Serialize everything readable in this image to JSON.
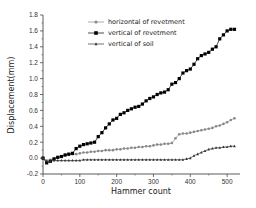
{
  "chart_data": {
    "type": "line",
    "title": "",
    "xlabel": "Hammer count",
    "ylabel": "Displacement(mm)",
    "xlim": [
      0,
      535
    ],
    "ylim": [
      -0.2,
      1.8
    ],
    "xticks": [
      0,
      100,
      200,
      300,
      400,
      500
    ],
    "yticks": [
      -0.2,
      0.0,
      0.2,
      0.4,
      0.6,
      0.8,
      1.0,
      1.2,
      1.4,
      1.6,
      1.8
    ],
    "grid": false,
    "legend_position": "upper-left-inside",
    "series": [
      {
        "name": "horizontal of revetment",
        "marker": "circle",
        "color": "#888888",
        "x": [
          0,
          10,
          20,
          30,
          40,
          50,
          60,
          70,
          80,
          90,
          100,
          110,
          120,
          130,
          140,
          150,
          160,
          170,
          180,
          190,
          200,
          210,
          220,
          230,
          240,
          250,
          260,
          270,
          280,
          290,
          300,
          310,
          320,
          330,
          340,
          350,
          360,
          370,
          380,
          390,
          400,
          410,
          420,
          430,
          440,
          450,
          460,
          470,
          480,
          490,
          500,
          510,
          520
        ],
        "y": [
          0.0,
          -0.03,
          -0.02,
          -0.01,
          0.01,
          0.02,
          0.03,
          0.04,
          0.05,
          0.05,
          0.06,
          0.07,
          0.07,
          0.08,
          0.08,
          0.09,
          0.09,
          0.1,
          0.1,
          0.1,
          0.11,
          0.11,
          0.12,
          0.12,
          0.13,
          0.13,
          0.14,
          0.14,
          0.15,
          0.15,
          0.16,
          0.17,
          0.17,
          0.18,
          0.18,
          0.19,
          0.25,
          0.3,
          0.31,
          0.31,
          0.32,
          0.33,
          0.34,
          0.35,
          0.36,
          0.37,
          0.38,
          0.4,
          0.41,
          0.43,
          0.45,
          0.48,
          0.5
        ]
      },
      {
        "name": "vertical of revetment",
        "marker": "square",
        "color": "#000000",
        "x": [
          0,
          10,
          20,
          30,
          40,
          50,
          60,
          70,
          80,
          90,
          100,
          110,
          120,
          130,
          140,
          150,
          160,
          170,
          180,
          190,
          200,
          210,
          220,
          230,
          240,
          250,
          260,
          270,
          280,
          290,
          300,
          310,
          320,
          330,
          340,
          350,
          360,
          370,
          380,
          390,
          400,
          410,
          420,
          430,
          440,
          450,
          460,
          470,
          480,
          490,
          500,
          510,
          520
        ],
        "y": [
          0.0,
          -0.06,
          -0.04,
          -0.01,
          0.01,
          0.02,
          0.04,
          0.05,
          0.06,
          0.12,
          0.15,
          0.17,
          0.18,
          0.19,
          0.2,
          0.27,
          0.32,
          0.38,
          0.43,
          0.48,
          0.5,
          0.55,
          0.57,
          0.6,
          0.62,
          0.64,
          0.65,
          0.68,
          0.72,
          0.75,
          0.77,
          0.8,
          0.82,
          0.83,
          0.86,
          0.93,
          0.95,
          1.0,
          1.07,
          1.1,
          1.12,
          1.18,
          1.25,
          1.29,
          1.31,
          1.33,
          1.37,
          1.4,
          1.5,
          1.55,
          1.6,
          1.62,
          1.62
        ]
      },
      {
        "name": "vertical of soil",
        "marker": "triangle",
        "color": "#333333",
        "x": [
          0,
          10,
          20,
          30,
          40,
          50,
          60,
          70,
          80,
          90,
          100,
          110,
          120,
          130,
          140,
          150,
          160,
          170,
          180,
          190,
          200,
          210,
          220,
          230,
          240,
          250,
          260,
          270,
          280,
          290,
          300,
          310,
          320,
          330,
          340,
          350,
          360,
          370,
          380,
          390,
          400,
          410,
          420,
          430,
          440,
          450,
          460,
          470,
          480,
          490,
          500,
          510,
          520
        ],
        "y": [
          0.0,
          -0.04,
          -0.04,
          -0.03,
          -0.03,
          -0.03,
          -0.03,
          -0.03,
          -0.03,
          -0.03,
          -0.03,
          -0.02,
          -0.02,
          -0.02,
          -0.02,
          -0.02,
          -0.02,
          -0.02,
          -0.02,
          -0.02,
          -0.02,
          -0.02,
          -0.02,
          -0.02,
          -0.02,
          -0.02,
          -0.02,
          -0.02,
          -0.02,
          -0.02,
          -0.02,
          -0.02,
          -0.02,
          -0.02,
          -0.02,
          -0.02,
          -0.02,
          -0.02,
          -0.02,
          -0.01,
          0.0,
          0.03,
          0.05,
          0.07,
          0.09,
          0.11,
          0.12,
          0.13,
          0.13,
          0.14,
          0.14,
          0.15,
          0.15
        ]
      }
    ]
  },
  "layout": {
    "plot": {
      "left": 43,
      "right": 240,
      "top": 15,
      "bottom": 174
    },
    "legend": {
      "x": 88,
      "y": 22,
      "row_gap": 11
    }
  }
}
